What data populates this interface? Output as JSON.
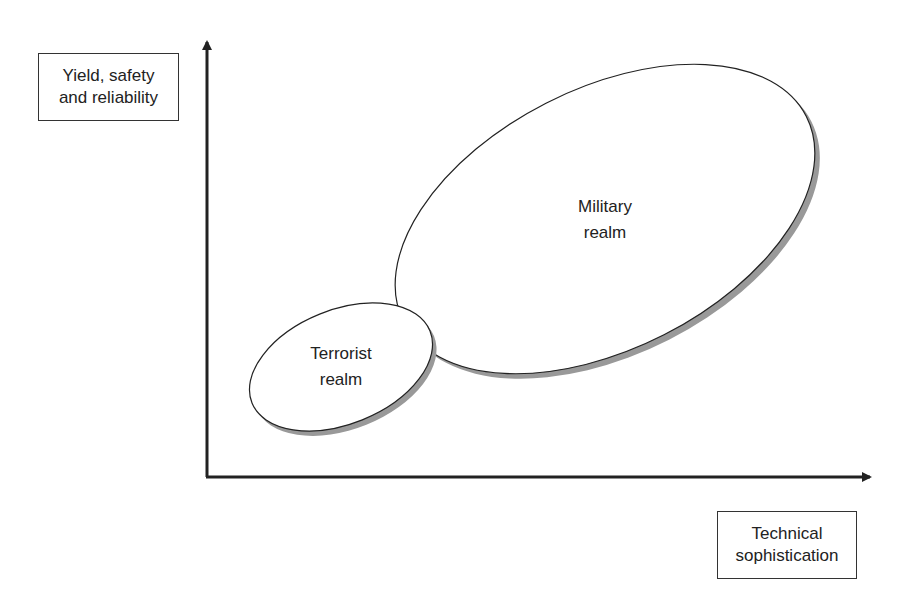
{
  "y_axis": {
    "label_line1": "Yield, safety",
    "label_line2": "and reliability"
  },
  "x_axis": {
    "label_line1": "Technical",
    "label_line2": "sophistication"
  },
  "regions": [
    {
      "name": "terrorist",
      "line1": "Terrorist",
      "line2": "realm"
    },
    {
      "name": "military",
      "line1": "Military",
      "line2": "realm"
    }
  ],
  "colors": {
    "line": "#222222",
    "shadow": "#999999",
    "fill": "#ffffff"
  }
}
